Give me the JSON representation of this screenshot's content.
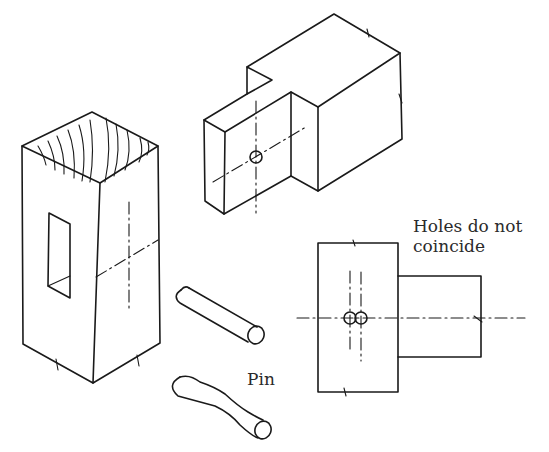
{
  "figure": {
    "ink_color": "#1a1a1a",
    "background_color": "#ffffff"
  },
  "parts": [
    {
      "id": "post",
      "description": "Square post with through mortise, end-grain shown on top"
    },
    {
      "id": "tenon-rail",
      "description": "Rail with reduced tenon, pin hole marked on tenon cheek"
    },
    {
      "id": "pin-straight",
      "description": "Straight wooden pin"
    },
    {
      "id": "pin-bent",
      "description": "Pin bent after being driven through offset holes"
    },
    {
      "id": "section-view",
      "description": "Elevation showing offset pin holes in post and tenon"
    }
  ],
  "labels": {
    "holes": "Holes do not coincide",
    "pin": "Pin"
  },
  "caption": {
    "visible": "partially clipped at bottom edge"
  }
}
